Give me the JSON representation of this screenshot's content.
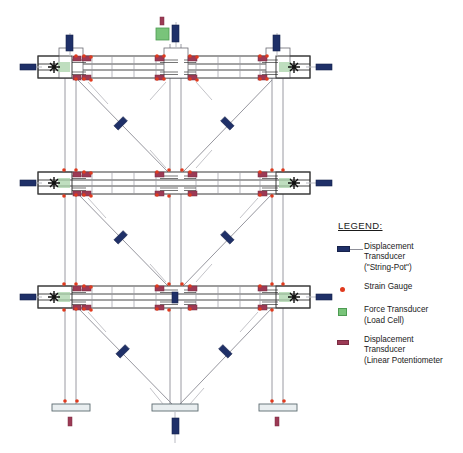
{
  "figure": {
    "type": "structural-instrumentation-elevation",
    "background_color": "#ffffff"
  },
  "legend": {
    "title": "LEGEND:",
    "items": [
      {
        "key": "displacement-transducer-string-pot",
        "marker": "blue-bar-with-line",
        "color": "#1f3068",
        "label": "Displacement\nTransducer\n(\"String-Pot\")"
      },
      {
        "key": "strain-gauge",
        "marker": "red-dot",
        "color": "#e03a1e",
        "label": "Strain Gauge"
      },
      {
        "key": "force-transducer-load-cell",
        "marker": "green-square",
        "color": "#79c47a",
        "label": "Force Transducer\n(Load Cell)"
      },
      {
        "key": "displacement-transducer-linear-potentiometer",
        "marker": "maroon-bar",
        "color": "#9c3a55",
        "label": "Displacement\nTransducer\n(Linear Potentiometer"
      }
    ]
  },
  "colors": {
    "string_pot": "#1f3068",
    "strain_gauge": "#e03a1e",
    "load_cell": "#79c47a",
    "load_cell_stroke": "#4d9b52",
    "linear_pot": "#9c3a55",
    "linear_pot_stroke": "#7b2c42",
    "steel_outline": "#3a3a3a",
    "member_line": "#8f9099",
    "brace_line": "#8a8a93",
    "beam_web": "#1a1a1a",
    "base_plate_fill": "#e9eef0"
  },
  "geometry": {
    "canvas": {
      "width": 463,
      "height": 453
    },
    "column_x": [
      70,
      175,
      277
    ],
    "column_pair_offset": 9,
    "beam_levels_y": [
      67,
      183,
      297
    ],
    "base_y": 408,
    "beam_left_x": 38,
    "beam_right_x": 310,
    "beam_half_height": 11,
    "end_block_width": 40
  },
  "instrumentation": {
    "string_pots": {
      "description": "Displacement transducers at beam ends, column tops, brace midpoints and center base",
      "beam_end_left_x": 22,
      "beam_end_right_x": 326,
      "count_beam_ends": 6,
      "count_braces": 6,
      "count_column_tops": 3,
      "count_base": 1
    },
    "strain_gauges": {
      "description": "Red dots clustered at beam-column joint panel zones and column bases",
      "count": 48
    },
    "load_cells": {
      "description": "Green square force transducer at top of center column",
      "count": 1
    },
    "linear_potentiometers": {
      "description": "Maroon bars at beam-column connection regions and column base",
      "count": 26
    }
  },
  "structure": {
    "stories": 3,
    "bays": 2,
    "bracing_pattern": "inverted-V / chevron diagonals per story",
    "base_supports": 3,
    "base_support_type": "base plate"
  }
}
